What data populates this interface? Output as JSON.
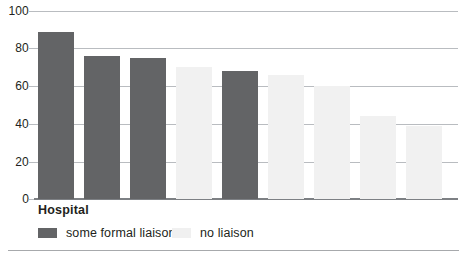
{
  "chart_data": {
    "type": "bar",
    "title": "",
    "subtitle": "",
    "xlabel": "Hospital",
    "ylabel": "",
    "ylim": [
      0,
      100
    ],
    "yticks": [
      0,
      20,
      40,
      60,
      80,
      100
    ],
    "ytick_labels": [
      "0",
      "20",
      "40",
      "60",
      "80",
      "100"
    ],
    "grid": true,
    "legend_position": "bottom-left",
    "categories": [
      "1",
      "2",
      "3",
      "4",
      "5",
      "6",
      "7",
      "8",
      "9"
    ],
    "values": [
      89,
      76,
      75,
      70,
      68,
      66,
      60,
      44,
      39
    ],
    "groups": [
      "some formal liaison",
      "some formal liaison",
      "some formal liaison",
      "no liaison",
      "some formal liaison",
      "no liaison",
      "no liaison",
      "no liaison",
      "no liaison"
    ],
    "series": [
      {
        "name": "some formal liaison",
        "color": "#636466",
        "points": [
          {
            "category": "1",
            "value": 89
          },
          {
            "category": "2",
            "value": 76
          },
          {
            "category": "3",
            "value": 75
          },
          {
            "category": "5",
            "value": 68
          }
        ]
      },
      {
        "name": "no liaison",
        "color": "#f1f1f1",
        "points": [
          {
            "category": "4",
            "value": 70
          },
          {
            "category": "6",
            "value": 66
          },
          {
            "category": "7",
            "value": 60
          },
          {
            "category": "8",
            "value": 44
          },
          {
            "category": "9",
            "value": 39
          }
        ]
      }
    ],
    "legend": [
      {
        "label": "some formal liaison",
        "color": "#636466"
      },
      {
        "label": "no liaison",
        "color": "#f0f0f0"
      }
    ]
  },
  "axis": {
    "x_title": "Hospital"
  },
  "colors": {
    "bar_dark": "#636466",
    "bar_light": "#f1f1f1",
    "gridline": "#b9bcc0",
    "baseline": "#7d8084",
    "text": "#231f20",
    "rule": "#a7a9ac",
    "background": "#ffffff"
  }
}
